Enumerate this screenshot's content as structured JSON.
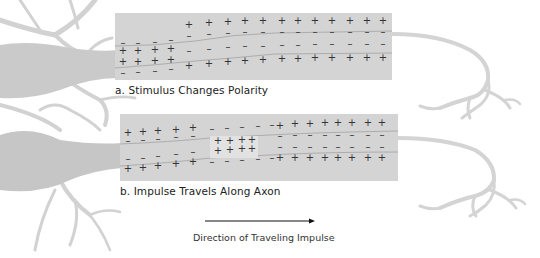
{
  "figure": {
    "panel_a": {
      "caption": "a. Stimulus  Changes Polarity",
      "top_row": [
        "-",
        "-",
        "-",
        "-",
        "+",
        "+",
        "+",
        "+",
        "+",
        "+",
        "+",
        "+",
        "+",
        "+",
        "+",
        "+",
        "+",
        "+"
      ],
      "upper_inner_row": [
        "-",
        "-",
        "-",
        "-",
        "-",
        "-",
        "-",
        "-",
        "-",
        "-",
        "-",
        "-",
        "-"
      ],
      "left_inner_plus": [
        "+",
        "+",
        "+",
        "+",
        "+",
        "+",
        "+",
        "+"
      ],
      "lower_inner_row": [
        "-",
        "-",
        "-",
        "-",
        "-",
        "-",
        "-",
        "-",
        "-",
        "-",
        "-",
        "-",
        "-"
      ],
      "bottom_row": [
        "-",
        "-",
        "-",
        "-",
        "+",
        "+",
        "+",
        "+",
        "+",
        "+",
        "+",
        "+",
        "+",
        "+",
        "+",
        "+",
        "+",
        "+"
      ]
    },
    "panel_b": {
      "caption": "b. Impulse Travels Along Axon",
      "leading_region_charge": "+",
      "impulse_zone_charge": "+",
      "resting_outer_charge": "+",
      "resting_inner_charge": "-"
    },
    "direction": {
      "label": "Direction of Traveling Impulse",
      "arrow": "right-arrow"
    },
    "colors": {
      "axon_fill": "#d4d4d4",
      "neuron_gray": "#c8c8c8",
      "impulse_zone": "#e2e2e2",
      "membrane_line": "#a8a8a8",
      "text": "#222222"
    }
  }
}
